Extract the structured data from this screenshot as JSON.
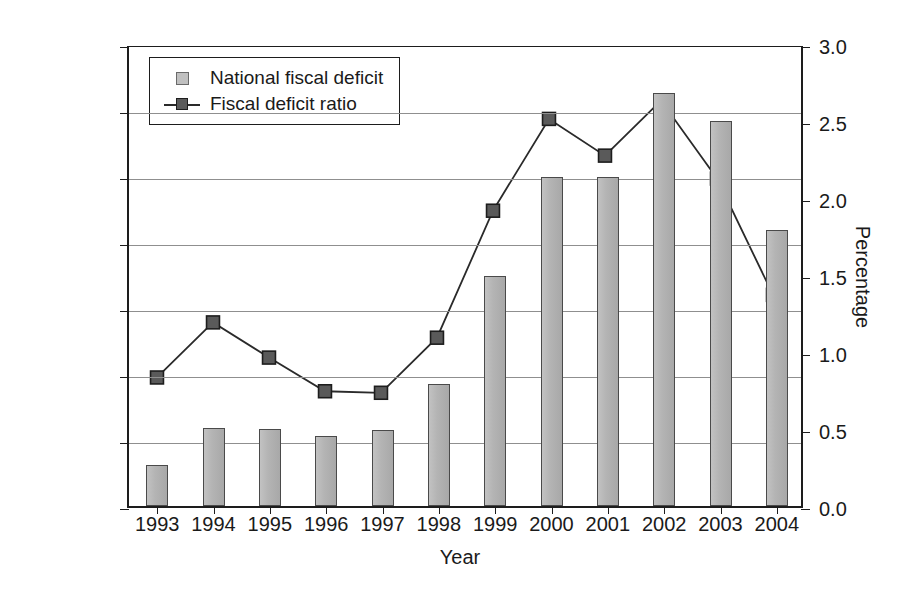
{
  "chart_data": {
    "type": "bar",
    "title": "",
    "subtitle": "",
    "xlabel": "Year",
    "ylabel": "100 million",
    "y2label": "Percentage",
    "categories": [
      "1993",
      "1994",
      "1995",
      "1996",
      "1997",
      "1998",
      "1999",
      "2000",
      "2001",
      "2002",
      "2003",
      "2004"
    ],
    "ylim": [
      0,
      3500
    ],
    "y2lim": [
      0,
      3.0
    ],
    "yticks": [
      "0",
      "500",
      "1000",
      "1500",
      "2000",
      "2500",
      "3000",
      "3500"
    ],
    "ytick_values": [
      0,
      500,
      1000,
      1500,
      2000,
      2500,
      3000,
      3500
    ],
    "y2ticks": [
      "0.0",
      "0.5",
      "1.0",
      "1.5",
      "2.0",
      "2.5",
      "3.0"
    ],
    "y2tick_values": [
      0.0,
      0.5,
      1.0,
      1.5,
      2.0,
      2.5,
      3.0
    ],
    "grid": true,
    "legend_position": "upper-left",
    "series": [
      {
        "name": "National fiscal deficit",
        "type": "bar",
        "axis": "left",
        "unit": "100 million",
        "color": "#b4b4b4",
        "edge_color": "#4a4a4a",
        "values": [
          310,
          590,
          580,
          530,
          575,
          925,
          1740,
          2490,
          2490,
          3130,
          2920,
          2090
        ]
      },
      {
        "name": "Fiscal deficit ratio",
        "type": "line",
        "axis": "right",
        "unit": "%",
        "color": "#2a2a2a",
        "marker_color": "#5a5a5a",
        "values": [
          0.84,
          1.2,
          0.97,
          0.75,
          0.74,
          1.1,
          1.93,
          2.53,
          2.29,
          2.65,
          2.14,
          1.38
        ]
      }
    ]
  },
  "legend": {
    "items": [
      {
        "label": "National fiscal deficit",
        "key": "bar-swatch"
      },
      {
        "label": "Fiscal deficit ratio",
        "key": "line-marker-swatch"
      }
    ]
  },
  "colors": {
    "bar_fill": "#b4b4b4",
    "bar_edge": "#4a4a4a",
    "line": "#2a2a2a",
    "marker_fill": "#5a5a5a",
    "marker_edge": "#1d1d1d",
    "grid": "#8f8f8f",
    "axis": "#1d1d1d",
    "background": "#ffffff"
  }
}
